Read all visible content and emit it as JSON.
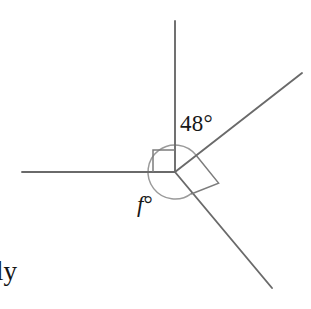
{
  "figure": {
    "kind": "angle-diagram",
    "canvas": {
      "width": 311,
      "height": 309,
      "background": "#ffffff"
    },
    "colors": {
      "ray": "#6a6a6a",
      "right_angle_marker": "#7c7c7c",
      "arc": "#9a9a9a",
      "text": "#171717"
    },
    "vertex": {
      "x": 175,
      "y": 172
    },
    "rays": [
      {
        "name": "ray-up",
        "direction_deg": 90,
        "end": {
          "x": 175,
          "y": 21
        }
      },
      {
        "name": "ray-left",
        "direction_deg": 180,
        "end": {
          "x": 22,
          "y": 172
        }
      },
      {
        "name": "ray-upper-right",
        "direction_deg": 38,
        "end": {
          "x": 302,
          "y": 73
        }
      },
      {
        "name": "ray-lower-right",
        "direction_deg": -52,
        "end": {
          "x": 272,
          "y": 288
        }
      }
    ],
    "right_angle_markers": [
      {
        "name": "right-angle-upper-left",
        "between": [
          "ray-up",
          "ray-left"
        ],
        "size": 22
      },
      {
        "name": "right-angle-between-diagonals",
        "between": [
          "ray-upper-right",
          "ray-lower-right"
        ],
        "size": 28
      }
    ],
    "arc": {
      "name": "angle-arc-f",
      "radius": 27,
      "from_ray": "ray-upper-right",
      "to_ray": "ray-lower-right",
      "sweep_deg": 270,
      "description": "arc measuring angle f, swept counterclockwise from the upper-right ray round through up, left and down to the lower-right ray"
    },
    "labels": {
      "angle_known": {
        "text": "48°",
        "value": 48,
        "unit": "degrees",
        "between": [
          "ray-up",
          "ray-upper-right"
        ]
      },
      "angle_unknown_letter": "f",
      "angle_unknown_degree_symbol": "°",
      "angle_unknown_full": "f°",
      "corner_text_fragment": "ly"
    }
  }
}
